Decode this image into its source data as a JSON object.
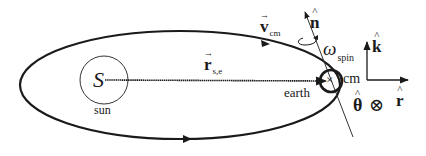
{
  "diagram": {
    "type": "orbital-mechanics",
    "colors": {
      "stroke": "#1a1a1a",
      "background": "#ffffff"
    },
    "sun": {
      "symbol": "S",
      "label": "sun"
    },
    "earth": {
      "label": "earth",
      "center_marker": "×",
      "cm_label": "cm"
    },
    "vectors": {
      "position": {
        "symbol": "r",
        "subscript": "s,e",
        "arrow": "→"
      },
      "velocity": {
        "symbol": "v",
        "subscript": "cm",
        "arrow": "→"
      },
      "spin_axis": {
        "symbol": "n",
        "hat": "^"
      },
      "spin_rate": {
        "symbol": "ω",
        "subscript": "spin"
      }
    },
    "axes": {
      "k": {
        "symbol": "k",
        "hat": "^"
      },
      "r": {
        "symbol": "r",
        "hat": "^"
      },
      "theta": {
        "symbol": "θ",
        "hat": "^",
        "into_page": "⊗"
      }
    }
  }
}
